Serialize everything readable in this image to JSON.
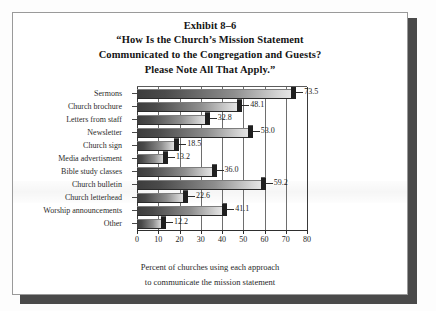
{
  "exhibit": {
    "number": "Exhibit 8–6",
    "title_line_1": "“How Is the Church’s Mission Statement",
    "title_line_2": "Communicated to the Congregation and Guests?",
    "title_line_3": "Please Note All That Apply.”"
  },
  "caption": {
    "line_1": "Percent of churches using each approach",
    "line_2": "to communicate the mission statement"
  },
  "chart_data": {
    "type": "bar",
    "orientation": "horizontal",
    "xlabel": "Percent of churches using each approach to communicate the mission statement",
    "ylabel": "",
    "categories": [
      "Sermons",
      "Church brochure",
      "Letters from staff",
      "Newsletter",
      "Church sign",
      "Media advertisment",
      "Bible study classes",
      "Church bulletin",
      "Church letterhead",
      "Worship announcements",
      "Other"
    ],
    "values": [
      73.5,
      48.1,
      32.8,
      53.0,
      18.5,
      13.2,
      36.0,
      59.2,
      22.6,
      41.1,
      12.2
    ],
    "value_labels": [
      "73.5",
      "48.1",
      "32.8",
      "53.0",
      "18.5",
      "13.2",
      "36.0",
      "59.2",
      "22.6",
      "41.1",
      "12.2"
    ],
    "xlim": [
      0,
      80
    ],
    "xticks": [
      0,
      10,
      20,
      30,
      40,
      50,
      60,
      70,
      80
    ],
    "xtick_labels": [
      "0",
      "10",
      "20",
      "30",
      "40",
      "50",
      "60",
      "70",
      "80"
    ],
    "grid": "vertical",
    "legend": "none",
    "bar_style": "3d-gradient",
    "colors": {
      "bar_dark": "#3d3d3d",
      "bar_light": "#e8e8e8",
      "bar_cap": "#1f1f1f",
      "gridline": "#6e6e6e",
      "axis": "#2e2e2e",
      "text": "#1c1c1c",
      "page": "#ffffff",
      "shadow": "#4a4a4a"
    }
  }
}
